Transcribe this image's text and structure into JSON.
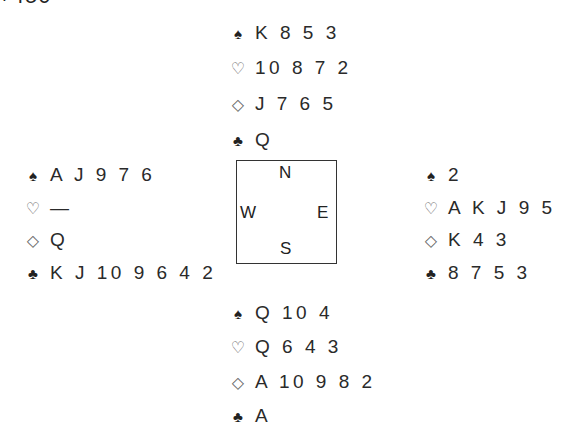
{
  "score": "+450",
  "hands": {
    "north": {
      "spades": "K 8 5 3",
      "hearts": "10 8 7 2",
      "diamonds": "J 7 6 5",
      "clubs": "Q"
    },
    "west": {
      "spades": "A J 9 7 6",
      "hearts": "—",
      "diamonds": "Q",
      "clubs": "K J 10 9 6 4 2"
    },
    "east": {
      "spades": "2",
      "hearts": "A K J 9 5",
      "diamonds": "K 4 3",
      "clubs": "8 7 5 3"
    },
    "south": {
      "spades": "Q 10 4",
      "hearts": "Q 6 4 3",
      "diamonds": "A 10 9 8 2",
      "clubs": "A"
    }
  },
  "suits": {
    "spades": "♠",
    "hearts": "♡",
    "diamonds": "◇",
    "clubs": "♣"
  },
  "compass": {
    "north": "N",
    "west": "W",
    "east": "E",
    "south": "S"
  }
}
